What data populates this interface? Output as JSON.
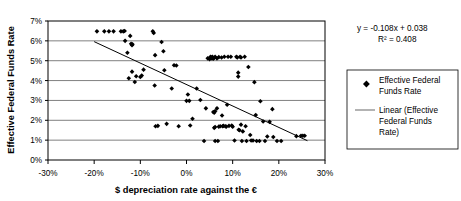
{
  "chart_data": {
    "type": "scatter",
    "title": "",
    "xlabel": "$ depreciation rate against the €",
    "ylabel": "Effective Federal Funds Rate",
    "xlim": [
      -0.3,
      0.3
    ],
    "ylim": [
      0.0,
      0.07
    ],
    "xticks": [
      -0.3,
      -0.2,
      -0.1,
      0.0,
      0.1,
      0.2,
      0.3
    ],
    "xtick_labels": [
      "-30%",
      "-20%",
      "-10%",
      "0%",
      "10%",
      "20%",
      "30%"
    ],
    "yticks": [
      0.0,
      0.01,
      0.02,
      0.03,
      0.04,
      0.05,
      0.06,
      0.07
    ],
    "ytick_labels": [
      "0%",
      "1%",
      "2%",
      "3%",
      "4%",
      "5%",
      "6%",
      "7%"
    ],
    "grid": "horizontal",
    "legend_position": "right",
    "series": [
      {
        "name": "Effective Federal Funds Rate",
        "marker": "diamond",
        "color": "#000000",
        "points": [
          [
            -0.194,
            0.0648
          ],
          [
            -0.178,
            0.0648
          ],
          [
            -0.168,
            0.0648
          ],
          [
            -0.158,
            0.0648
          ],
          [
            -0.142,
            0.0648
          ],
          [
            -0.137,
            0.0648
          ],
          [
            -0.134,
            0.065
          ],
          [
            -0.133,
            0.06
          ],
          [
            -0.122,
            0.0625
          ],
          [
            -0.12,
            0.0585
          ],
          [
            -0.118,
            0.0578
          ],
          [
            -0.117,
            0.0583
          ],
          [
            -0.128,
            0.054
          ],
          [
            -0.125,
            0.0412
          ],
          [
            -0.118,
            0.0445
          ],
          [
            -0.112,
            0.0393
          ],
          [
            -0.109,
            0.0422
          ],
          [
            -0.1,
            0.0418
          ],
          [
            -0.097,
            0.0425
          ],
          [
            -0.093,
            0.0455
          ],
          [
            -0.073,
            0.0648
          ],
          [
            -0.071,
            0.064
          ],
          [
            -0.068,
            0.0528
          ],
          [
            -0.069,
            0.0375
          ],
          [
            -0.067,
            0.017
          ],
          [
            -0.062,
            0.0172
          ],
          [
            -0.054,
            0.0594
          ],
          [
            -0.05,
            0.0548
          ],
          [
            -0.048,
            0.0452
          ],
          [
            -0.043,
            0.0182
          ],
          [
            -0.032,
            0.036
          ],
          [
            -0.027,
            0.0477
          ],
          [
            -0.022,
            0.0476
          ],
          [
            -0.017,
            0.017
          ],
          [
            0.0,
            0.0298
          ],
          [
            0.003,
            0.033
          ],
          [
            0.006,
            0.0298
          ],
          [
            0.008,
            0.0174
          ],
          [
            0.013,
            0.0208
          ],
          [
            0.022,
            0.036
          ],
          [
            0.03,
            0.0302
          ],
          [
            0.038,
            0.0096
          ],
          [
            0.042,
            0.026
          ],
          [
            0.046,
            0.0512
          ],
          [
            0.05,
            0.0508
          ],
          [
            0.052,
            0.052
          ],
          [
            0.053,
            0.0516
          ],
          [
            0.055,
            0.0512
          ],
          [
            0.056,
            0.052
          ],
          [
            0.058,
            0.051
          ],
          [
            0.06,
            0.0515
          ],
          [
            0.062,
            0.052
          ],
          [
            0.058,
            0.0242
          ],
          [
            0.06,
            0.0238
          ],
          [
            0.062,
            0.0246
          ],
          [
            0.06,
            0.0162
          ],
          [
            0.062,
            0.0166
          ],
          [
            0.062,
            0.0096
          ],
          [
            0.066,
            0.0512
          ],
          [
            0.07,
            0.0518
          ],
          [
            0.066,
            0.026
          ],
          [
            0.068,
            0.0096
          ],
          [
            0.07,
            0.0168
          ],
          [
            0.073,
            0.017
          ],
          [
            0.076,
            0.0516
          ],
          [
            0.077,
            0.0224
          ],
          [
            0.078,
            0.017
          ],
          [
            0.08,
            0.0172
          ],
          [
            0.082,
            0.052
          ],
          [
            0.084,
            0.017
          ],
          [
            0.086,
            0.0168
          ],
          [
            0.088,
            0.0278
          ],
          [
            0.09,
            0.052
          ],
          [
            0.092,
            0.0172
          ],
          [
            0.096,
            0.052
          ],
          [
            0.098,
            0.0174
          ],
          [
            0.1,
            0.0168
          ],
          [
            0.104,
            0.0098
          ],
          [
            0.108,
            0.052
          ],
          [
            0.11,
            0.0516
          ],
          [
            0.112,
            0.044
          ],
          [
            0.112,
            0.042
          ],
          [
            0.113,
            0.0152
          ],
          [
            0.115,
            0.015
          ],
          [
            0.116,
            0.052
          ],
          [
            0.118,
            0.0516
          ],
          [
            0.118,
            0.0178
          ],
          [
            0.12,
            0.0096
          ],
          [
            0.122,
            0.0144
          ],
          [
            0.126,
            0.052
          ],
          [
            0.128,
            0.017
          ],
          [
            0.13,
            0.0096
          ],
          [
            0.134,
            0.0468
          ],
          [
            0.138,
            0.0126
          ],
          [
            0.14,
            0.0098
          ],
          [
            0.144,
            0.0098
          ],
          [
            0.147,
            0.0392
          ],
          [
            0.15,
            0.0226
          ],
          [
            0.152,
            0.0096
          ],
          [
            0.158,
            0.0096
          ],
          [
            0.16,
            0.0296
          ],
          [
            0.166,
            0.0194
          ],
          [
            0.17,
            0.0096
          ],
          [
            0.175,
            0.0118
          ],
          [
            0.18,
            0.0192
          ],
          [
            0.186,
            0.0256
          ],
          [
            0.188,
            0.0116
          ],
          [
            0.196,
            0.0096
          ],
          [
            0.205,
            0.0096
          ],
          [
            0.238,
            0.012
          ],
          [
            0.248,
            0.0122
          ],
          [
            0.252,
            0.0122
          ],
          [
            0.256,
            0.0122
          ]
        ]
      }
    ],
    "trendline": {
      "name": "Linear (Effective Federal Funds Rate)",
      "equation": "y = -0.108x + 0.038",
      "r_squared_label": "R² = 0.408",
      "slope": -0.108,
      "intercept": 0.038,
      "r_squared": 0.408,
      "x_start": -0.2,
      "x_end": 0.262,
      "color": "#000000"
    }
  },
  "annotations": {
    "equation_line1": "y = -0.108x + 0.038",
    "equation_line2": "R² = 0.408"
  },
  "legend": {
    "items": [
      {
        "label_line1": "Effective Federal",
        "label_line2": "Funds Rate",
        "type": "marker"
      },
      {
        "label_line1": "Linear (Effective",
        "label_line2": "Federal Funds",
        "label_line3": "Rate)",
        "type": "line"
      }
    ]
  },
  "colors": {
    "plot_border": "#000000",
    "gridline": "#808080",
    "marker": "#000000",
    "trendline": "#000000",
    "background": "#ffffff"
  }
}
